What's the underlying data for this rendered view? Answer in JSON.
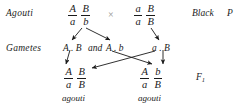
{
  "diagram": {
    "row_labels": {
      "parents": "Agouti",
      "gametes": "Gametes"
    },
    "cross_symbol": "×",
    "parents": [
      {
        "name": "parent-left",
        "allele_pair_1": {
          "numerator": "A",
          "denominator": "a"
        },
        "allele_pair_2": {
          "numerator": "B",
          "denominator": "b"
        },
        "phenotype": "Agouti"
      },
      {
        "name": "parent-right",
        "allele_pair_1": {
          "numerator": "a",
          "denominator": "a"
        },
        "allele_pair_2": {
          "numerator": "B",
          "denominator": "B"
        },
        "phenotype": "Black"
      }
    ],
    "parent_generation_label": "P",
    "parent_phenotype_right": "Black",
    "gametes": {
      "left": "A . B",
      "conjunction": "and",
      "left_second": "A . b",
      "right": "a . B"
    },
    "offspring": [
      {
        "name": "f1-left",
        "allele_pair_1": {
          "numerator": "A",
          "denominator": "a"
        },
        "allele_pair_2": {
          "numerator": "B",
          "denominator": "B"
        },
        "phenotype": "agouti"
      },
      {
        "name": "f1-right",
        "allele_pair_1": {
          "numerator": "A",
          "denominator": "a"
        },
        "allele_pair_2": {
          "numerator": "b",
          "denominator": "B"
        },
        "phenotype": "agouti"
      }
    ],
    "offspring_generation_label": "F",
    "offspring_generation_subscript": "1",
    "colors": {
      "text": "#1a1a1a",
      "arrow": "#1a1a1a",
      "cross_symbol": "#8e8e8e",
      "background": "#ffffff"
    }
  }
}
